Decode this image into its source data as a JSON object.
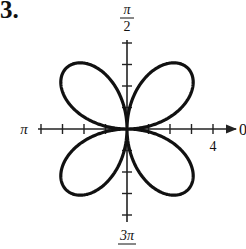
{
  "problem": {
    "number": "3."
  },
  "chart_data": {
    "type": "polar",
    "title": "",
    "curve": "four-petal rose r = 4 sin(2θ)",
    "equation": {
      "a": 4,
      "n": 2,
      "func": "sin"
    },
    "petals": 4,
    "max_radius": 4,
    "angle_labels": {
      "zero": "0",
      "half_pi_num": "π",
      "half_pi_den": "2",
      "pi": "π",
      "three_half_pi_num": "3π",
      "three_half_pi_den": "2"
    },
    "radial_tick_label": "4",
    "radial_ticks": [
      1,
      2,
      3,
      4
    ],
    "axis_range": [
      -4,
      4
    ],
    "grid": false,
    "line_color": "#111111",
    "axis_color": "#222222"
  }
}
